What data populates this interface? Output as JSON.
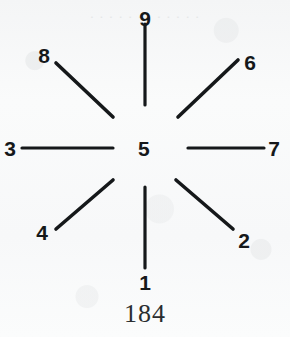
{
  "figure": {
    "caption": "184",
    "center": {
      "label": "5",
      "name": "center-node"
    },
    "ghost_text": "· · · · · · · · · · · ·",
    "ink_color": "#15181a",
    "paper_color": "#f8f9f9",
    "spokes": [
      {
        "label": "9",
        "direction": "up",
        "angle_deg": 90,
        "x1": 145,
        "y1": 105,
        "x2": 145,
        "y2": 24,
        "label_x": 145,
        "label_y": 8
      },
      {
        "label": "6",
        "direction": "up-right",
        "angle_deg": 45,
        "x1": 178,
        "y1": 117,
        "x2": 238,
        "y2": 60,
        "label_x": 250,
        "label_y": 52
      },
      {
        "label": "7",
        "direction": "right",
        "angle_deg": 0,
        "x1": 188,
        "y1": 148,
        "x2": 264,
        "y2": 148,
        "label_x": 274,
        "label_y": 138
      },
      {
        "label": "2",
        "direction": "down-right",
        "angle_deg": -45,
        "x1": 176,
        "y1": 180,
        "x2": 233,
        "y2": 229,
        "label_x": 244,
        "label_y": 230
      },
      {
        "label": "1",
        "direction": "down",
        "angle_deg": -90,
        "x1": 145,
        "y1": 187,
        "x2": 145,
        "y2": 268,
        "label_x": 145,
        "label_y": 272
      },
      {
        "label": "4",
        "direction": "down-left",
        "angle_deg": -135,
        "x1": 113,
        "y1": 180,
        "x2": 56,
        "y2": 229,
        "label_x": 42,
        "label_y": 222
      },
      {
        "label": "3",
        "direction": "left",
        "angle_deg": 180,
        "x1": 22,
        "y1": 148,
        "x2": 113,
        "y2": 148,
        "label_x": 10,
        "label_y": 138
      },
      {
        "label": "8",
        "direction": "up-left",
        "angle_deg": 135,
        "x1": 113,
        "y1": 117,
        "x2": 56,
        "y2": 63,
        "label_x": 44,
        "label_y": 45
      }
    ]
  }
}
